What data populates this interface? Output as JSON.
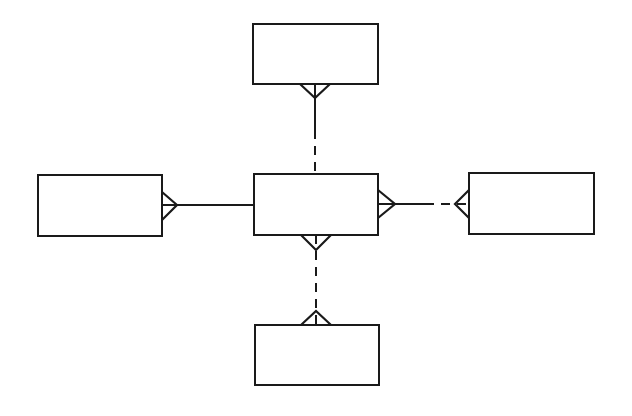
{
  "diagram": {
    "type": "entity-relationship",
    "notation": "crow's foot",
    "colors": {
      "stroke": "#1a1a1a",
      "background": "#ffffff"
    },
    "entities": [
      {
        "id": "top",
        "label": "",
        "x": 253,
        "y": 24,
        "w": 125,
        "h": 60
      },
      {
        "id": "left",
        "label": "",
        "x": 38,
        "y": 175,
        "w": 124,
        "h": 61
      },
      {
        "id": "center",
        "label": "",
        "x": 254,
        "y": 174,
        "w": 124,
        "h": 61
      },
      {
        "id": "right",
        "label": "",
        "x": 469,
        "y": 173,
        "w": 125,
        "h": 61
      },
      {
        "id": "bottom",
        "label": "",
        "x": 255,
        "y": 325,
        "w": 124,
        "h": 60
      }
    ],
    "relationships": [
      {
        "from": "center",
        "to": "top",
        "many_end": "top",
        "line": "solid-near-top, dashed-near-center"
      },
      {
        "from": "center",
        "to": "left",
        "many_end": "left",
        "line": "solid"
      },
      {
        "from": "center",
        "to": "right",
        "many_end": "both",
        "line": "solid-near-center, dashed-near-right"
      },
      {
        "from": "center",
        "to": "bottom",
        "many_end": "both",
        "line": "dashed"
      }
    ]
  }
}
